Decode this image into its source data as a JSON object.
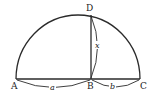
{
  "diagram": {
    "points": {
      "A": {
        "label": "A",
        "x": 16,
        "y": 79
      },
      "B": {
        "label": "B",
        "x": 91,
        "y": 79
      },
      "C": {
        "label": "C",
        "x": 140,
        "y": 79
      },
      "D": {
        "label": "D",
        "x": 91,
        "y": 14
      }
    },
    "segments": {
      "a": {
        "label": "a",
        "from": "A",
        "to": "B"
      },
      "b": {
        "label": "b",
        "from": "B",
        "to": "C"
      },
      "x": {
        "label": "x",
        "from": "B",
        "to": "D"
      }
    },
    "colors": {
      "stroke": "#2a2a2a",
      "background": "#ffffff"
    }
  }
}
